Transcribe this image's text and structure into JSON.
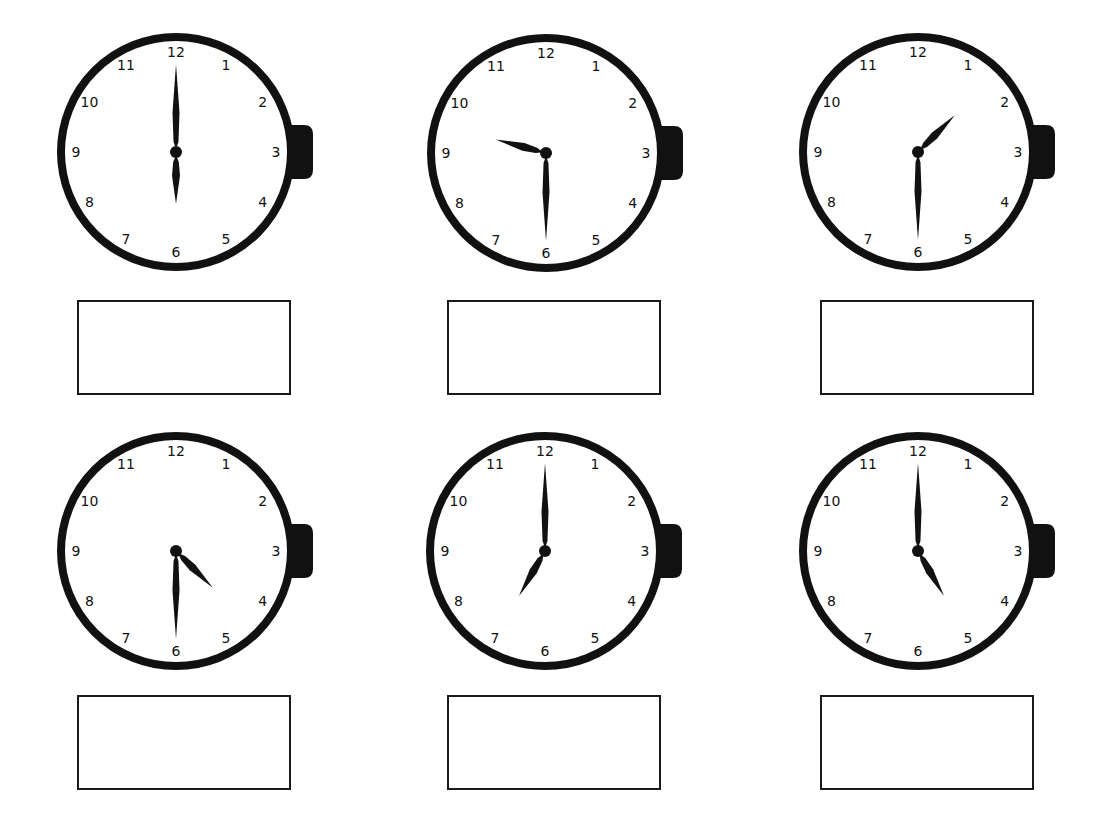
{
  "worksheet": {
    "clock_numbers": [
      "12",
      "1",
      "2",
      "3",
      "4",
      "5",
      "6",
      "7",
      "8",
      "9",
      "10",
      "11"
    ],
    "colors": {
      "ink": "#111111",
      "paper": "#ffffff"
    },
    "clocks": [
      {
        "id": "clock-1",
        "cx": 176,
        "cy": 152,
        "time": "6:00",
        "hour_angle": 180,
        "minute_angle": 0
      },
      {
        "id": "clock-2",
        "cx": 546,
        "cy": 153,
        "time": "9:30",
        "hour_angle": 285,
        "minute_angle": 180
      },
      {
        "id": "clock-3",
        "cx": 918,
        "cy": 152,
        "time": "1:30",
        "hour_angle": 45,
        "minute_angle": 180
      },
      {
        "id": "clock-4",
        "cx": 176,
        "cy": 551,
        "time": "4:30",
        "hour_angle": 135,
        "minute_angle": 180
      },
      {
        "id": "clock-5",
        "cx": 545,
        "cy": 551,
        "time": "7:00",
        "hour_angle": 210,
        "minute_angle": 0
      },
      {
        "id": "clock-6",
        "cx": 918,
        "cy": 551,
        "time": "5:00",
        "hour_angle": 150,
        "minute_angle": 0
      }
    ],
    "answer_boxes": [
      {
        "id": "answer-1",
        "x": 77,
        "y": 300,
        "value": ""
      },
      {
        "id": "answer-2",
        "x": 447,
        "y": 300,
        "value": ""
      },
      {
        "id": "answer-3",
        "x": 820,
        "y": 300,
        "value": ""
      },
      {
        "id": "answer-4",
        "x": 77,
        "y": 695,
        "value": ""
      },
      {
        "id": "answer-5",
        "x": 447,
        "y": 695,
        "value": ""
      },
      {
        "id": "answer-6",
        "x": 820,
        "y": 695,
        "value": ""
      }
    ]
  }
}
